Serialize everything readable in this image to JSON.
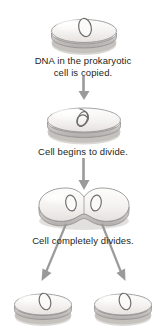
{
  "diagram": {
    "type": "vertical-flowchart",
    "background_color": "#ffffff",
    "text_color": "#231f20",
    "arrow_color": "#9a9a9a",
    "cell_fill": "#f2f0ee",
    "cell_outline": "#8d8d8d",
    "cell_shadow": "#b8b5b2",
    "nucleoid_outline": "#6e6e6e",
    "steps": [
      {
        "id": "step-1",
        "caption": "DNA in the prokaryotic\ncell is copied.",
        "illustration": "prokaryotic-cell-single-nucleoid",
        "nucleoid_count": 1
      },
      {
        "id": "step-2",
        "caption": "Cell begins to divide.",
        "illustration": "prokaryotic-cell-elongating-nucleoid",
        "nucleoid_count": 1
      },
      {
        "id": "step-3",
        "caption": "Cell completely divides.",
        "illustration": "prokaryotic-cell-constricting-two-nucleoids",
        "nucleoid_count": 2
      },
      {
        "id": "step-4",
        "caption": "",
        "illustration": "two-daughter-cells",
        "nucleoid_count": 2
      }
    ],
    "connectors": [
      {
        "id": "arrow-1",
        "kind": "down-arrow"
      },
      {
        "id": "arrow-2",
        "kind": "down-arrow"
      },
      {
        "id": "arrow-3-left",
        "kind": "diverging-arrow-left"
      },
      {
        "id": "arrow-3-right",
        "kind": "diverging-arrow-right"
      }
    ]
  }
}
